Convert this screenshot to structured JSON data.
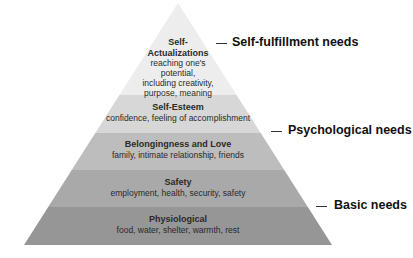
{
  "diagram": {
    "type": "pyramid",
    "layers": [
      {
        "title_lines": [
          "Self-",
          "Actualizations"
        ],
        "desc_lines": [
          "reaching one's",
          "potential,",
          "including creativity,",
          "purpose, meaning"
        ],
        "color": "#ededed"
      },
      {
        "title_lines": [
          "Self-Esteem"
        ],
        "desc_lines": [
          "confidence, feeling of accomplishment"
        ],
        "color": "#d7d7d7"
      },
      {
        "title_lines": [
          "Belongingness and Love"
        ],
        "desc_lines": [
          "family, intimate relationship, friends"
        ],
        "color": "#bdbdbd"
      },
      {
        "title_lines": [
          "Safety"
        ],
        "desc_lines": [
          "employment, health, security, safety"
        ],
        "color": "#a9a9a9"
      },
      {
        "title_lines": [
          "Physiological"
        ],
        "desc_lines": [
          "food, water, shelter, warmth, rest"
        ],
        "color": "#969696"
      }
    ],
    "need_groups": [
      {
        "label": "Self-fulfillment needs"
      },
      {
        "label": "Psychological needs"
      },
      {
        "label": "Basic needs"
      }
    ]
  }
}
